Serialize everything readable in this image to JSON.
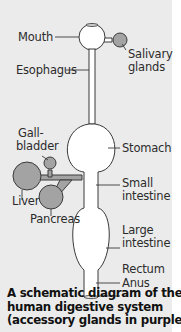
{
  "diagram": {
    "labels": {
      "mouth": "Mouth",
      "salivary_glands_1": "Salivary",
      "salivary_glands_2": "glands",
      "esophagus": "Esophagus",
      "gallbladder_1": "Gall-",
      "gallbladder_2": "bladder",
      "stomach": "Stomach",
      "small_intestine_1": "Small",
      "small_intestine_2": "intestine",
      "liver": "Liver",
      "pancreas": "Pancreas",
      "large_intestine_1": "Large",
      "large_intestine_2": "intestine",
      "rectum": "Rectum",
      "anus": "Anus"
    },
    "caption": {
      "line1": "A schematic diagram of the",
      "line2": "human digestive system",
      "line3": "(accessory glands in purple)"
    },
    "colors": {
      "background": "#ebebeb",
      "tract_fill": "#ffffff",
      "accessory_gland_fill": "#a3a3a3",
      "outline": "#3a3a3a"
    }
  }
}
